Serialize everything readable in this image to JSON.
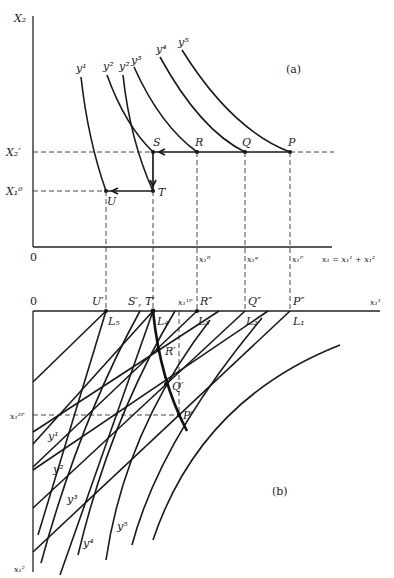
{
  "panel_a": {
    "tag": "(a)",
    "y_axis_label": "X₂",
    "origin_label": "0",
    "x_axis_label": "x₁ = x₁¹ + x₁²",
    "level_labels": {
      "X2_prime": "X₂′",
      "X1_zero": "X₁⁰"
    },
    "curve_labels": [
      "y¹",
      "y²",
      "y²",
      "y³",
      "y⁴",
      "y⁵"
    ],
    "points": {
      "P": "P",
      "Q": "Q",
      "R": "R",
      "S": "S",
      "T": "T",
      "U": "U"
    },
    "tick_labels": {
      "xR": "x₁ᴿ",
      "xQ": "x₁ᵠ",
      "xP": "x₁ᴾ"
    }
  },
  "panel_b": {
    "tag": "(b)",
    "origin_label": "0",
    "x_axis_label": "x₁¹",
    "y_axis_label": "x₁²",
    "top_labels": {
      "U": "U′",
      "ST": "S′, T′",
      "x1P": "x₁¹ᴾ",
      "R": "R″",
      "Q": "Q″",
      "P": "P″"
    },
    "L_labels": [
      "L₁",
      "L₂",
      "L₃",
      "L₄",
      "L₅"
    ],
    "contract_points": {
      "R": "R′",
      "Q": "Q′",
      "P": "P′"
    },
    "x2P_label": "x₁²ᴾ",
    "curve_labels": [
      "y¹",
      "y²",
      "y³",
      "y⁴",
      "y⁵"
    ]
  }
}
